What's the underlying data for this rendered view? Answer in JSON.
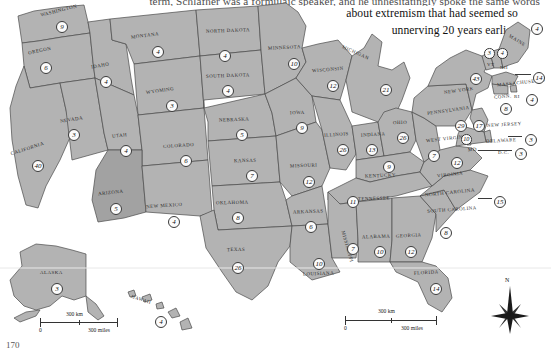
{
  "page": {
    "folio": "170",
    "body_text": {
      "line0": "term, Schlafher was a formulaic speaker, and he unhesitatingly spoke the same words",
      "line1": "about extremism that had seemed so",
      "line2": "unnerving 20 years earlier."
    }
  },
  "map": {
    "title": "United States electoral vote map",
    "compass": {
      "north_label": "N"
    },
    "scale_bars": [
      {
        "id": "inset-scale",
        "zero": "0",
        "km": "300 km",
        "miles": "300 miles"
      },
      {
        "id": "main-scale",
        "zero": "0",
        "km": "300 km",
        "miles": "300 miles"
      }
    ],
    "colors": {
      "state_fill": "#b3b3b3",
      "state_fill_highlight": "#a2a2a2",
      "state_border": "#4a4a4a",
      "badge_fill": "#fbfbfb",
      "badge_border": "#3a3a3a",
      "page_bg": "#ffffff"
    },
    "states": [
      {
        "code": "WA",
        "label": "WASHINGTON",
        "votes": "9",
        "lx": 40,
        "ly": 8,
        "rot": -14,
        "bx": 56,
        "by": 21,
        "size": ""
      },
      {
        "code": "OR",
        "label": "OREGON",
        "votes": "6",
        "lx": 28,
        "ly": 48,
        "rot": -12,
        "bx": 40,
        "by": 62,
        "size": ""
      },
      {
        "code": "CA",
        "label": "CALIFORNIA",
        "votes": "40",
        "lx": 10,
        "ly": 146,
        "rot": -18,
        "bx": 32,
        "by": 160,
        "size": ""
      },
      {
        "code": "NV",
        "label": "NEVADA",
        "votes": "3",
        "lx": 60,
        "ly": 117,
        "rot": -9,
        "bx": 68,
        "by": 129,
        "size": ""
      },
      {
        "code": "ID",
        "label": "IDAHO",
        "votes": "4",
        "lx": 91,
        "ly": 63,
        "rot": -10,
        "bx": 100,
        "by": 76,
        "size": ""
      },
      {
        "code": "MT",
        "label": "MONTANA",
        "votes": "4",
        "lx": 131,
        "ly": 33,
        "rot": -7,
        "bx": 152,
        "by": 46,
        "size": ""
      },
      {
        "code": "WY",
        "label": "WYOMING",
        "votes": "3",
        "lx": 146,
        "ly": 88,
        "rot": -8,
        "bx": 166,
        "by": 100,
        "size": ""
      },
      {
        "code": "UT",
        "label": "UTAH",
        "votes": "4",
        "lx": 112,
        "ly": 133,
        "rot": -6,
        "bx": 120,
        "by": 145,
        "size": ""
      },
      {
        "code": "CO",
        "label": "COLORADO",
        "votes": "6",
        "lx": 163,
        "ly": 143,
        "rot": -4,
        "bx": 180,
        "by": 155,
        "size": ""
      },
      {
        "code": "AZ",
        "label": "ARIZONA",
        "votes": "5",
        "lx": 98,
        "ly": 190,
        "rot": -6,
        "bx": 110,
        "by": 203,
        "size": ""
      },
      {
        "code": "NM",
        "label": "NEW MEXICO",
        "votes": "4",
        "lx": 146,
        "ly": 203,
        "rot": -4,
        "bx": 168,
        "by": 216,
        "size": ""
      },
      {
        "code": "ND",
        "label": "NORTH DAKOTA",
        "votes": "4",
        "lx": 206,
        "ly": 28,
        "rot": -2,
        "bx": 219,
        "by": 50,
        "size": ""
      },
      {
        "code": "SD",
        "label": "SOUTH DAKOTA",
        "votes": "4",
        "lx": 206,
        "ly": 73,
        "rot": -2,
        "bx": 222,
        "by": 85,
        "size": ""
      },
      {
        "code": "NE",
        "label": "NEBRASKA",
        "votes": "5",
        "lx": 219,
        "ly": 117,
        "rot": -2,
        "bx": 236,
        "by": 129,
        "size": ""
      },
      {
        "code": "KS",
        "label": "KANSAS",
        "votes": "7",
        "lx": 234,
        "ly": 158,
        "rot": -1,
        "bx": 246,
        "by": 170,
        "size": ""
      },
      {
        "code": "OK",
        "label": "OKLAHOMA",
        "votes": "8",
        "lx": 216,
        "ly": 200,
        "rot": -1,
        "bx": 232,
        "by": 212,
        "size": ""
      },
      {
        "code": "TX",
        "label": "TEXAS",
        "votes": "26",
        "lx": 227,
        "ly": 247,
        "rot": -1,
        "bx": 232,
        "by": 262,
        "size": ""
      },
      {
        "code": "MN",
        "label": "MINNESOTA",
        "votes": "10",
        "lx": 268,
        "ly": 45,
        "rot": -3,
        "bx": 288,
        "by": 58,
        "size": ""
      },
      {
        "code": "IA",
        "label": "IOWA",
        "votes": "9",
        "lx": 290,
        "ly": 110,
        "rot": -2,
        "bx": 296,
        "by": 122,
        "size": ""
      },
      {
        "code": "MO",
        "label": "MISSOURI",
        "votes": "12",
        "lx": 290,
        "ly": 163,
        "rot": -2,
        "bx": 303,
        "by": 176,
        "size": ""
      },
      {
        "code": "AR",
        "label": "ARKANSAS",
        "votes": "6",
        "lx": 293,
        "ly": 209,
        "rot": -2,
        "bx": 305,
        "by": 221,
        "size": ""
      },
      {
        "code": "LA",
        "label": "LOUISIANA",
        "votes": "10",
        "lx": 303,
        "ly": 271,
        "rot": -2,
        "bx": 313,
        "by": 258,
        "size": ""
      },
      {
        "code": "WI",
        "label": "WISCONSIN",
        "votes": "12",
        "lx": 312,
        "ly": 67,
        "rot": -5,
        "bx": 327,
        "by": 80,
        "size": ""
      },
      {
        "code": "IL",
        "label": "ILLINOIS",
        "votes": "26",
        "lx": 324,
        "ly": 132,
        "rot": -4,
        "bx": 337,
        "by": 144,
        "size": ""
      },
      {
        "code": "IN",
        "label": "INDIANA",
        "votes": "13",
        "lx": 361,
        "ly": 132,
        "rot": -3,
        "bx": 366,
        "by": 144,
        "size": ""
      },
      {
        "code": "MI",
        "label": "MICHIGAN",
        "votes": "21",
        "lx": 341,
        "ly": 50,
        "rot": 24,
        "bx": 380,
        "by": 84,
        "size": ""
      },
      {
        "code": "OH",
        "label": "OHIO",
        "votes": "26",
        "lx": 393,
        "ly": 120,
        "rot": -2,
        "bx": 397,
        "by": 132,
        "size": ""
      },
      {
        "code": "KY",
        "label": "KENTUCKY",
        "votes": "9",
        "lx": 365,
        "ly": 173,
        "rot": -2,
        "bx": 383,
        "by": 161,
        "size": ""
      },
      {
        "code": "TN",
        "label": "TENNESSEE",
        "votes": "11",
        "lx": 358,
        "ly": 196,
        "rot": -2,
        "bx": 347,
        "by": 196,
        "size": ""
      },
      {
        "code": "MS",
        "label": "MISSISSIPPI",
        "votes": "7",
        "lx": 331,
        "ly": 244,
        "rot": 74,
        "bx": 347,
        "by": 243,
        "size": ""
      },
      {
        "code": "AL",
        "label": "ALABAMA",
        "votes": "10",
        "lx": 362,
        "ly": 234,
        "rot": -2,
        "bx": 374,
        "by": 246,
        "size": ""
      },
      {
        "code": "GA",
        "label": "GEORGIA",
        "votes": "12",
        "lx": 396,
        "ly": 233,
        "rot": -3,
        "bx": 405,
        "by": 246,
        "size": ""
      },
      {
        "code": "FL",
        "label": "FLORIDA",
        "votes": "14",
        "lx": 414,
        "ly": 270,
        "rot": -3,
        "bx": 430,
        "by": 283,
        "size": ""
      },
      {
        "code": "SC",
        "label": "SOUTH CAROLINA",
        "votes": "8",
        "lx": 427,
        "ly": 207,
        "rot": -4,
        "bx": 440,
        "by": 227,
        "size": ""
      },
      {
        "code": "NC",
        "label": "NORTH CAROLINA",
        "votes": "15",
        "lx": 425,
        "ly": 190,
        "rot": -6,
        "bx": 494,
        "by": 196,
        "size": ""
      },
      {
        "code": "VA",
        "label": "VIRGINIA",
        "votes": "12",
        "lx": 437,
        "ly": 172,
        "rot": -7,
        "bx": 451,
        "by": 157,
        "size": ""
      },
      {
        "code": "WV",
        "label": "WEST VIRGINIA",
        "votes": "7",
        "lx": 426,
        "ly": 136,
        "rot": -6,
        "bx": 428,
        "by": 150,
        "size": ""
      },
      {
        "code": "PA",
        "label": "PENNSYLVANIA",
        "votes": "29",
        "lx": 427,
        "ly": 108,
        "rot": -8,
        "bx": 455,
        "by": 120,
        "size": ""
      },
      {
        "code": "NY",
        "label": "NEW YORK",
        "votes": "43",
        "lx": 444,
        "ly": 88,
        "rot": -8,
        "bx": 470,
        "by": 73,
        "size": ""
      },
      {
        "code": "VT",
        "label": "VT",
        "votes": "3",
        "lx": 487,
        "ly": 62,
        "rot": 0,
        "bx": 484,
        "by": 48,
        "size": "s"
      },
      {
        "code": "NH",
        "label": "NH",
        "votes": "4",
        "lx": 500,
        "ly": 65,
        "rot": 0,
        "bx": 497,
        "by": 48,
        "size": "s"
      },
      {
        "code": "ME",
        "label": "MAINE",
        "votes": "4",
        "lx": 508,
        "ly": 38,
        "rot": 32,
        "bx": 531,
        "by": 23,
        "size": ""
      },
      {
        "code": "MA",
        "label": "MASSACHUSETTS",
        "votes": "14",
        "lx": 497,
        "ly": 80,
        "rot": -6,
        "bx": 533,
        "by": 72,
        "size": ""
      },
      {
        "code": "RI",
        "label": "RI",
        "votes": "4",
        "lx": 514,
        "ly": 94,
        "rot": 0,
        "bx": 526,
        "by": 94,
        "size": ""
      },
      {
        "code": "CT",
        "label": "CONN.",
        "votes": "8",
        "lx": 494,
        "ly": 94,
        "rot": -5,
        "bx": 500,
        "by": 103,
        "size": ""
      },
      {
        "code": "NJ",
        "label": "NEW JERSEY",
        "votes": "17",
        "lx": 487,
        "ly": 122,
        "rot": -3,
        "bx": 473,
        "by": 120,
        "size": ""
      },
      {
        "code": "DE",
        "label": "DELAWARE",
        "votes": "3",
        "lx": 486,
        "ly": 138,
        "rot": -3,
        "bx": 525,
        "by": 134,
        "size": ""
      },
      {
        "code": "MD",
        "label": "MD.",
        "votes": "10",
        "lx": 468,
        "ly": 147,
        "rot": -3,
        "bx": 461,
        "by": 134,
        "size": "s"
      },
      {
        "code": "DC",
        "label": "D.C.",
        "votes": "3",
        "lx": 498,
        "ly": 150,
        "rot": 0,
        "bx": 515,
        "by": 148,
        "size": ""
      },
      {
        "code": "AK",
        "label": "ALASKA",
        "votes": "3",
        "lx": 40,
        "ly": 270,
        "rot": 0,
        "bx": 51,
        "by": 283,
        "size": ""
      },
      {
        "code": "HI",
        "label": "HAWAII",
        "votes": "4",
        "lx": 131,
        "ly": 297,
        "rot": 18,
        "bx": 155,
        "by": 316,
        "size": ""
      }
    ]
  }
}
